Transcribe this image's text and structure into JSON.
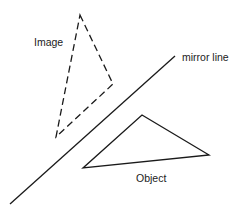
{
  "labels": {
    "image": "Image",
    "mirror_line": "mirror line",
    "object": "Object"
  },
  "colors": {
    "stroke": "#1a1a1a",
    "text": "#222222",
    "background": "#ffffff"
  },
  "shapes": {
    "image_triangle": {
      "style": "dashed",
      "points": [
        [
          80,
          15
        ],
        [
          113,
          84
        ],
        [
          56,
          137
        ]
      ]
    },
    "object_triangle": {
      "style": "solid",
      "points": [
        [
          142,
          115
        ],
        [
          209,
          155
        ],
        [
          83,
          168
        ]
      ]
    },
    "mirror_line": {
      "style": "solid",
      "from": [
        10,
        204
      ],
      "to": [
        175,
        56
      ]
    }
  }
}
